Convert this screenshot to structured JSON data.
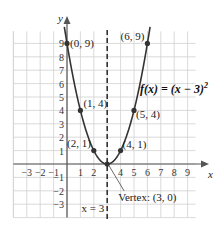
{
  "chart_data": {
    "type": "line",
    "title": "",
    "function_label": "f(x) = (x − 3)²",
    "function_label_parts": {
      "main": "f(x) = (x − 3)",
      "exp": "2"
    },
    "xlabel": "x",
    "ylabel": "y",
    "xlim": [
      -4,
      10
    ],
    "ylim": [
      -4,
      10
    ],
    "grid": true,
    "x_ticks": [
      "−3",
      "−2",
      "−1",
      "1",
      "2",
      "4",
      "5",
      "6",
      "7",
      "8",
      "9"
    ],
    "y_ticks": [
      "9",
      "8",
      "7",
      "6",
      "5",
      "4",
      "3",
      "2",
      "1",
      "−1",
      "−2",
      "−3"
    ],
    "points": [
      {
        "x": 0,
        "y": 9,
        "label": "(0, 9)"
      },
      {
        "x": 1,
        "y": 4,
        "label": "(1, 4)"
      },
      {
        "x": 2,
        "y": 1,
        "label": "(2, 1)"
      },
      {
        "x": 3,
        "y": 0,
        "label": ""
      },
      {
        "x": 4,
        "y": 1,
        "label": "(4, 1)"
      },
      {
        "x": 5,
        "y": 4,
        "label": "(5, 4)"
      },
      {
        "x": 6,
        "y": 9,
        "label": "(6, 9)"
      }
    ],
    "axis_of_symmetry": {
      "x": 3,
      "label": "x = 3"
    },
    "vertex": {
      "x": 3,
      "y": 0,
      "label": "Vertex: (3, 0)"
    }
  }
}
